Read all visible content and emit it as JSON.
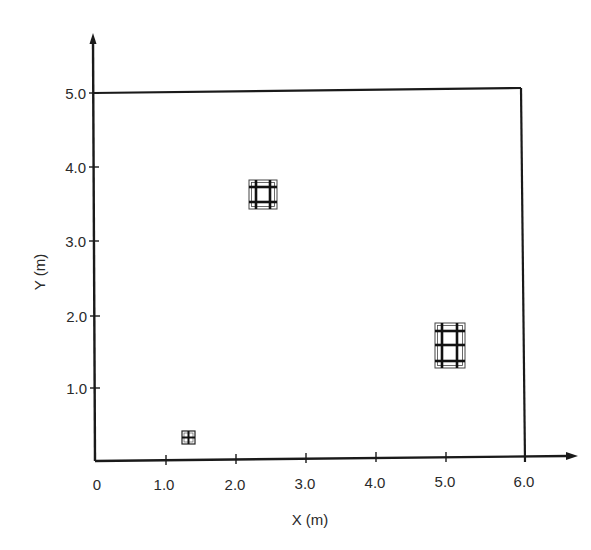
{
  "diagram": {
    "type": "floor-plan",
    "x_axis": {
      "label": "X (m)",
      "ticks": [
        "0",
        "1.0",
        "2.0",
        "3.0",
        "4.0",
        "5.0",
        "6.0"
      ],
      "range": [
        0,
        6.5
      ]
    },
    "y_axis": {
      "label": "Y (m)",
      "ticks": [
        "1.0",
        "2.0",
        "3.0",
        "4.0",
        "5.0"
      ],
      "range": [
        0,
        5.8
      ]
    },
    "boundary": {
      "description": "Rectangular room boundary",
      "x": [
        0,
        6.0
      ],
      "y": [
        0,
        5.0
      ]
    },
    "objects": [
      {
        "name": "grid-object-1",
        "description": "Square grid block (3x3 lattice)",
        "x_range": [
          2.2,
          2.55
        ],
        "y_range": [
          3.45,
          3.85
        ],
        "cols": 3,
        "rows": 3
      },
      {
        "name": "grid-object-2",
        "description": "Rectangular grid block (3x4 lattice)",
        "x_range": [
          4.8,
          5.2
        ],
        "y_range": [
          1.3,
          1.95
        ],
        "cols": 3,
        "rows": 4
      },
      {
        "name": "grid-object-3",
        "description": "Small square grid block (2x2 lattice)",
        "x_range": [
          1.22,
          1.4
        ],
        "y_range": [
          0.22,
          0.4
        ],
        "cols": 2,
        "rows": 2
      }
    ],
    "colors": {
      "line": "#1a1a1a",
      "text": "#2a2a2a",
      "background": "#ffffff"
    }
  }
}
